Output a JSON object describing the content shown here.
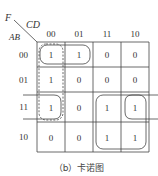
{
  "kmap": {
    "output_var": "F",
    "row_vars": "AB",
    "col_vars": "CD",
    "col_labels": [
      "00",
      "01",
      "11",
      "10"
    ],
    "row_labels": [
      "00",
      "01",
      "11",
      "10"
    ],
    "cells": [
      [
        "1",
        "1",
        "0",
        "0"
      ],
      [
        "1",
        "0",
        "0",
        "0"
      ],
      [
        "1",
        "0",
        "1",
        "1"
      ],
      [
        "0",
        "0",
        "1",
        "1"
      ]
    ],
    "groups": [
      {
        "name": "group-row00-cols00-01",
        "style": "solid",
        "rows": [
          0
        ],
        "cols": [
          0,
          1
        ]
      },
      {
        "name": "group-col00-rows00-11",
        "style": "dashed",
        "rows": [
          0,
          1,
          2
        ],
        "cols": [
          0
        ]
      },
      {
        "name": "group-rows11-10-cols11-10",
        "style": "solid",
        "rows": [
          2,
          3
        ],
        "cols": [
          2,
          3
        ]
      },
      {
        "name": "group-row11-wrap",
        "style": "solid",
        "rows": [
          2
        ],
        "cols": [
          0,
          3
        ],
        "wrap": true
      }
    ]
  },
  "caption": "（b）卡诺图"
}
